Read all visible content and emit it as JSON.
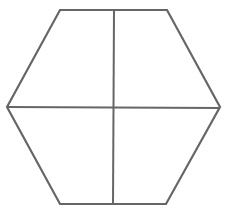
{
  "diagram": {
    "shape": "hexagon divided into four parts",
    "stroke_color": "#666666",
    "background": "#ffffff",
    "hexagon_points": [
      [
        60,
        10
      ],
      [
        167,
        10
      ],
      [
        220,
        107
      ],
      [
        166,
        204
      ],
      [
        60,
        204
      ],
      [
        7,
        107
      ]
    ],
    "vertical_divider": {
      "x1": 114,
      "y1": 10,
      "x2": 113,
      "y2": 204
    },
    "horizontal_divider": {
      "x1": 7,
      "y1": 107,
      "x2": 220,
      "y2": 108
    }
  }
}
